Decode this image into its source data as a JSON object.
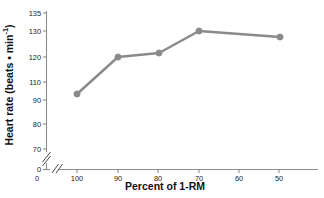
{
  "chart_data": {
    "type": "line",
    "title": "",
    "xlabel": "Percent of 1-RM",
    "ylabel": "Heart rate (beats • min⁻¹)",
    "ylabel_parts": {
      "main": "Heart rate (beats • min",
      "sup": "-1",
      "tail": ")"
    },
    "categories": [
      "100",
      "90",
      "80",
      "70",
      "60",
      "50"
    ],
    "x": [
      100,
      90,
      80,
      70,
      60,
      50
    ],
    "values": [
      92.7,
      120.0,
      121.5,
      131.0,
      null,
      129.5
    ],
    "series": [
      {
        "name": "Heart rate",
        "color": "#8a8a8a",
        "values": [
          92.7,
          120.0,
          121.5,
          131.0,
          null,
          129.5
        ]
      }
    ],
    "yticks": [
      0,
      70,
      80,
      90,
      110,
      120,
      130,
      135
    ],
    "ytick_labels": [
      "0",
      "70",
      "80",
      "90",
      "110",
      "120",
      "130",
      "135"
    ],
    "xticks": [
      0,
      100,
      90,
      80,
      70,
      60,
      50
    ],
    "xtick_labels": [
      "0",
      "100",
      "90",
      "80",
      "70",
      "60",
      "50"
    ],
    "ylim": [
      68,
      136
    ],
    "xlim": [
      105,
      44
    ],
    "grid": false,
    "legend": false,
    "axis_break_y": true,
    "axis_break_x": true,
    "marker": "circle",
    "marker_color": "#8a8a8a",
    "line_color": "#8a8a8a",
    "axis_color": "#8c8c8c"
  },
  "axis": {
    "y_labels": [
      {
        "text": "135",
        "y": 13
      },
      {
        "text": "130",
        "y": 31
      },
      {
        "text": "120",
        "y": 57
      },
      {
        "text": "110",
        "y": 82
      },
      {
        "text": "90",
        "y": 100
      },
      {
        "text": "80",
        "y": 124
      },
      {
        "text": "70",
        "y": 149
      },
      {
        "text": "0",
        "y": 168
      }
    ],
    "x_labels": [
      {
        "text": "0",
        "x": 37
      },
      {
        "text": "100",
        "x": 77
      },
      {
        "text": "90",
        "x": 118
      },
      {
        "text": "80",
        "x": 158
      },
      {
        "text": "70",
        "x": 199
      },
      {
        "text": "60",
        "x": 239
      },
      {
        "text": "50",
        "x": 279
      }
    ]
  },
  "points": [
    {
      "label": "100",
      "value": "92.7",
      "cx": 77,
      "cy": 94
    },
    {
      "label": "90",
      "value": "120.0",
      "cx": 118,
      "cy": 57
    },
    {
      "label": "80",
      "value": "121.5",
      "cx": 159,
      "cy": 53
    },
    {
      "label": "70",
      "value": "131.0",
      "cx": 199,
      "cy": 31
    },
    {
      "label": "50",
      "value": "129.5",
      "cx": 280,
      "cy": 37
    }
  ]
}
